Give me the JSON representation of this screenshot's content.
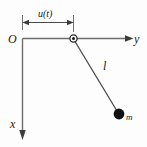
{
  "figure": {
    "type": "mechanics-schematic",
    "colors": {
      "background": "#fdfdfd",
      "stroke": "#6e6e6e",
      "rod": "#4a4a4a",
      "bob": "#111111",
      "text": "#1a1a1a"
    },
    "axes": {
      "origin_label": "O",
      "horizontal_axis_label": "y",
      "vertical_axis_label": "x"
    },
    "dimension": {
      "label": "u(t)",
      "description": "horizontal displacement of pivot from origin"
    },
    "pendulum": {
      "rod_label": "l",
      "mass_label": "m",
      "pivot_name": "pivot",
      "bob_name": "point-mass"
    }
  }
}
